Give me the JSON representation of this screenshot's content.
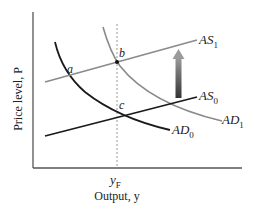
{
  "diagram": {
    "type": "AS-AD diagram",
    "axes": {
      "y_label": "Price level, P",
      "x_label": "Output, y",
      "x_tick": {
        "main": "y",
        "sub": "F"
      }
    },
    "curves": {
      "as1": {
        "main": "AS",
        "sub": "1",
        "color": "#8a8a8a"
      },
      "as0": {
        "main": "AS",
        "sub": "0",
        "color": "#1a1a1a"
      },
      "ad0": {
        "main": "AD",
        "sub": "0",
        "color": "#1a1a1a"
      },
      "ad1": {
        "main": "AD",
        "sub": "1",
        "color": "#8a8a8a"
      }
    },
    "points": {
      "a": "a",
      "b": "b",
      "c": "c"
    },
    "colors": {
      "axis": "#555555",
      "dashed": "#999999",
      "arrow_top": "#888888",
      "arrow_bottom": "#333333"
    }
  }
}
